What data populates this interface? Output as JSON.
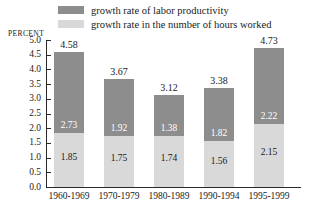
{
  "chart_data": {
    "type": "bar",
    "subtype": "stacked",
    "title": "",
    "xlabel": "",
    "ylabel": "PERCENT",
    "ylim": [
      0.0,
      5.0
    ],
    "ytick_step": 0.5,
    "grid": false,
    "legend_position": "top",
    "categories": [
      "1960-1969",
      "1970-1979",
      "1980-1989",
      "1990-1994",
      "1995-1999"
    ],
    "series": [
      {
        "name": "growth rate of labor productivity",
        "color": "#8d8d8d",
        "values": [
          2.73,
          1.92,
          1.38,
          1.82,
          2.22
        ]
      },
      {
        "name": "growth rate in the number of hours worked",
        "color": "#d9d9d9",
        "values": [
          1.85,
          1.75,
          1.74,
          1.56,
          2.15
        ]
      }
    ],
    "totals": [
      4.58,
      3.67,
      3.12,
      3.38,
      4.73
    ],
    "ytick_labels": [
      "5.0",
      "4.5",
      "4.0",
      "3.5",
      "3.0",
      "2.5",
      "2.0",
      "1.5",
      "1.0",
      "0.5",
      "0.0"
    ]
  },
  "legend": {
    "items": [
      {
        "label": "growth rate of labor productivity",
        "color": "#8d8d8d"
      },
      {
        "label": "growth rate in the number of hours worked",
        "color": "#d9d9d9"
      }
    ]
  },
  "axis": {
    "percent_caption": "PERCENT",
    "y_ticks": [
      "5.0",
      "4.5",
      "4.0",
      "3.5",
      "3.0",
      "2.5",
      "2.0",
      "1.5",
      "1.0",
      "0.5",
      "0.0"
    ],
    "x_ticks": [
      "1960-1969",
      "1970-1979",
      "1980-1989",
      "1990-1994",
      "1995-1999"
    ]
  },
  "bars": [
    {
      "category": "1960-1969",
      "total": "4.58",
      "dark": "2.73",
      "light": "1.85"
    },
    {
      "category": "1970-1979",
      "total": "3.67",
      "dark": "1.92",
      "light": "1.75"
    },
    {
      "category": "1980-1989",
      "total": "3.12",
      "dark": "1.38",
      "light": "1.74"
    },
    {
      "category": "1990-1994",
      "total": "3.38",
      "dark": "1.82",
      "light": "1.56"
    },
    {
      "category": "1995-1999",
      "total": "4.73",
      "dark": "2.22",
      "light": "2.15"
    }
  ]
}
